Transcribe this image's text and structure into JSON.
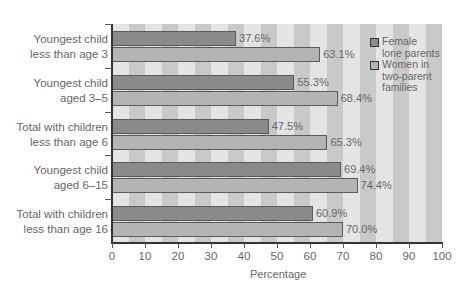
{
  "chart_data": {
    "type": "bar",
    "orientation": "horizontal",
    "title": "",
    "xlabel": "Percentage",
    "ylabel": "",
    "xlim": [
      0,
      100
    ],
    "xticks": [
      0,
      10,
      20,
      30,
      40,
      50,
      60,
      70,
      80,
      90,
      100
    ],
    "grid": "alternating vertical bands every 5",
    "legend_position": "upper right, inside plot",
    "categories": [
      "Youngest child less than age 3",
      "Youngest child aged 3–5",
      "Total with children less than age 6",
      "Youngest child aged 6–15",
      "Total with children less than age 16"
    ],
    "category_lines": [
      [
        "Youngest child",
        "less than age 3"
      ],
      [
        "Youngest child",
        "aged 3–5"
      ],
      [
        "Total with children",
        "less than age 6"
      ],
      [
        "Youngest child",
        "aged 6–15"
      ],
      [
        "Total with children",
        "less than age 16"
      ]
    ],
    "series": [
      {
        "name": "Female lone parents",
        "legend_lines": [
          "Female",
          "lone parents"
        ],
        "color": "#8a8a8a",
        "values": [
          37.6,
          55.3,
          47.5,
          69.4,
          60.9
        ],
        "labels": [
          "37.6%",
          "55.3%",
          "47.5%",
          "69.4%",
          "60.9%"
        ]
      },
      {
        "name": "Women in two-parent families",
        "legend_lines": [
          "Women in",
          "two-parent",
          "families"
        ],
        "color": "#b4b4b4",
        "values": [
          63.1,
          68.4,
          65.3,
          74.4,
          70.0
        ],
        "labels": [
          "63.1%",
          "68.4%",
          "65.3%",
          "74.4%",
          "70.0%"
        ]
      }
    ],
    "background_colors": {
      "light_band": "#e4e4e4",
      "dark_band": "#c9c9c9"
    }
  }
}
